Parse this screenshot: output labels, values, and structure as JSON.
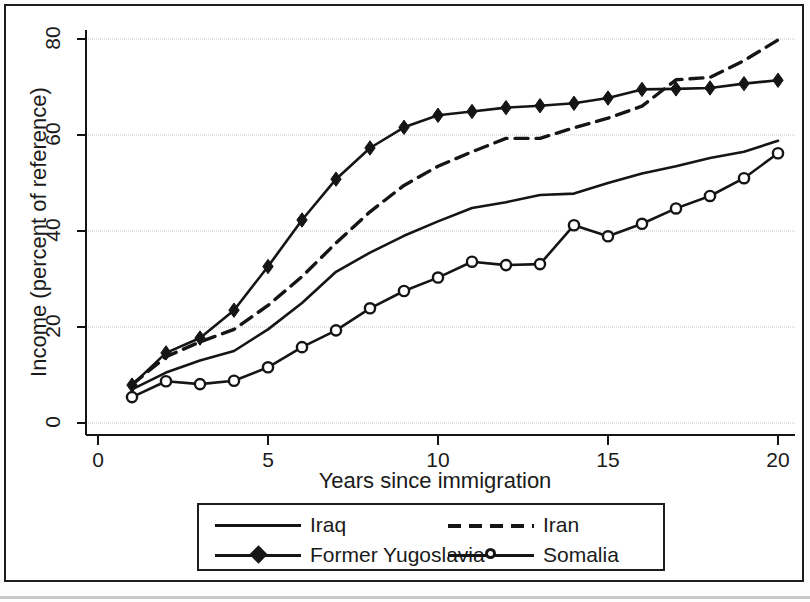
{
  "figure": {
    "kind": "line-chart",
    "background": "#ffffff",
    "line_color": "#151515",
    "grid_color": "#c5c5c5"
  },
  "chart_data": {
    "type": "line",
    "title": "",
    "xlabel": "Years since immigration",
    "ylabel": "Income (percent of reference)",
    "xlim": [
      0,
      20.6
    ],
    "ylim": [
      -3,
      84
    ],
    "xticks": [
      0,
      5,
      10,
      15,
      20
    ],
    "xtick_labels": [
      "0",
      "5",
      "10",
      "15",
      "20"
    ],
    "yticks": [
      0,
      20,
      40,
      60,
      80
    ],
    "ytick_labels": [
      "0",
      "20",
      "40",
      "60",
      "80"
    ],
    "grid": "horizontal",
    "legend_position": "below-axes",
    "x": [
      1,
      2,
      3,
      4,
      5,
      6,
      7,
      8,
      9,
      10,
      11,
      12,
      13,
      14,
      15,
      16,
      17,
      18,
      19,
      20
    ],
    "series": [
      {
        "name": "Iraq",
        "style": "solid",
        "marker": "none",
        "values": [
          7.0,
          10.5,
          13.0,
          15.0,
          19.5,
          25.0,
          31.5,
          35.5,
          39.0,
          42.0,
          44.8,
          46.0,
          47.5,
          47.8,
          50.0,
          52.0,
          53.5,
          55.2,
          56.5,
          58.8
        ]
      },
      {
        "name": "Former Yugoslavia",
        "style": "solid",
        "marker": "diamond",
        "values": [
          7.9,
          14.6,
          17.7,
          23.5,
          32.6,
          42.3,
          50.8,
          57.3,
          61.6,
          64.1,
          64.9,
          65.7,
          66.1,
          66.6,
          67.7,
          69.5,
          69.6,
          69.8,
          70.7,
          71.4
        ]
      },
      {
        "name": "Iran",
        "style": "dashed",
        "marker": "none",
        "values": [
          8.0,
          13.8,
          16.9,
          19.5,
          24.5,
          30.5,
          37.5,
          44.0,
          49.5,
          53.5,
          56.5,
          59.3,
          59.3,
          61.5,
          63.5,
          66.0,
          71.5,
          72.0,
          75.5,
          79.8
        ]
      },
      {
        "name": "Somalia",
        "style": "solid",
        "marker": "circle",
        "values": [
          5.4,
          8.7,
          8.1,
          8.8,
          11.6,
          15.8,
          19.3,
          23.9,
          27.5,
          30.3,
          33.6,
          32.9,
          33.1,
          41.2,
          38.9,
          41.5,
          44.7,
          47.3,
          51.0,
          56.2
        ]
      }
    ]
  },
  "legend": {
    "entries": [
      {
        "label": "Iraq",
        "key": "solid-line"
      },
      {
        "label": "Iran",
        "key": "dashed-line"
      },
      {
        "label": "Former Yugoslavia",
        "key": "solid-line-diamond"
      },
      {
        "label": "Somalia",
        "key": "solid-line-circle"
      }
    ]
  }
}
